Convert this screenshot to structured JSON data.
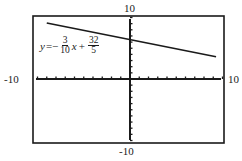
{
  "chart_data": {
    "type": "line",
    "title": "",
    "xlabel": "",
    "ylabel": "",
    "xlim": [
      -10,
      10
    ],
    "ylim": [
      -10,
      10
    ],
    "x_tick_labels": {
      "left": "-10",
      "right": "10"
    },
    "y_tick_labels": {
      "top": "10",
      "bottom": "-10"
    },
    "tick_spacing": 1,
    "grid": false,
    "series": [
      {
        "name": "y = -3/10 x + 32/5",
        "slope": -0.3,
        "intercept": 6.4,
        "x": [
          -9,
          9.3
        ],
        "y": [
          9.1,
          3.61
        ]
      }
    ],
    "annotation": {
      "lhs": "y",
      "equals": "=",
      "sign1": "−",
      "frac1_num": "3",
      "frac1_den": "10",
      "var": "x",
      "sign2": "+",
      "frac2_num": "32",
      "frac2_den": "5"
    }
  }
}
